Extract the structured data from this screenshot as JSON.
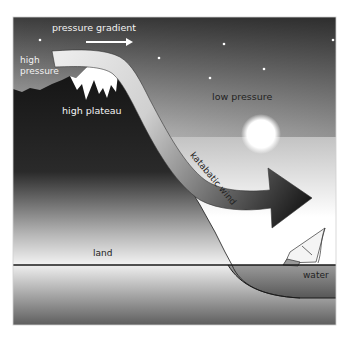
{
  "diagram": {
    "title": "Katabatic wind",
    "labels": {
      "pressure_gradient": "pressure gradient",
      "high_pressure_line1": "high",
      "high_pressure_line2": "pressure",
      "high_plateau": "high plateau",
      "low_pressure": "low pressure",
      "katabatic_wind": "katabatic wind",
      "land": "land",
      "water": "water"
    },
    "icons": [
      "pressure-gradient-arrow-icon",
      "moon-icon",
      "star-icon",
      "sailboat-icon",
      "mountain-icon",
      "wind-arrow-icon"
    ],
    "colors": {
      "sky_top": "#3a3a3a",
      "sky_bottom": "#ffffff",
      "mountain": "#141414",
      "snow": "#ffffff",
      "arrow_start": "#e6e6e6",
      "arrow_end": "#1a1a1a",
      "water_dark": "#6a6a6a",
      "ground_top": "#f0f0f0",
      "ground_bottom": "#5a5a5a"
    }
  }
}
